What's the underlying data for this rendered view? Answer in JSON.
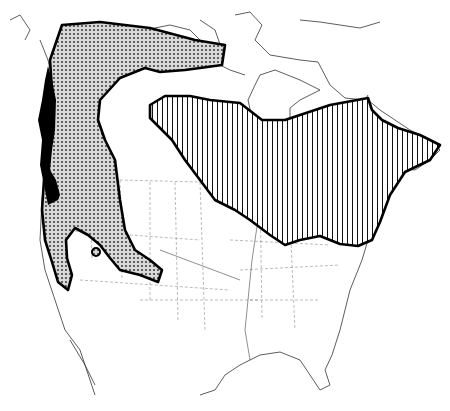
{
  "map": {
    "title": "",
    "region": "North America",
    "legend": [],
    "ranges": [
      {
        "id": "western-range",
        "pattern": "stipple",
        "fill": "#b8b8b8"
      },
      {
        "id": "eastern-range",
        "pattern": "vertical-hatch",
        "fill": "#ffffff"
      },
      {
        "id": "isolated-population",
        "pattern": "stipple",
        "fill": "#b8b8b8"
      }
    ],
    "colors": {
      "outline": "#000000",
      "stipple": "#555555",
      "background": "#ffffff"
    }
  }
}
